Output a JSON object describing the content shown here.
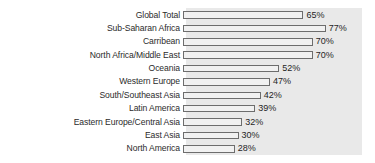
{
  "chart_data": {
    "type": "bar",
    "orientation": "horizontal",
    "title": "",
    "subtitle": "",
    "xlabel": "",
    "ylabel": "",
    "xlim": [
      0,
      95
    ],
    "grid": false,
    "legend": null,
    "value_suffix": "%",
    "categories": [
      "Global Total",
      "Sub-Saharan Africa",
      "Carribean",
      "North Africa/Middle East",
      "Oceania",
      "Western Europe",
      "South/Southeast Asia",
      "Latin America",
      "Eastern Europe/Central Asia",
      "East Asia",
      "North America"
    ],
    "values": [
      65,
      77,
      70,
      70,
      52,
      47,
      42,
      39,
      32,
      30,
      28
    ],
    "value_labels": [
      "65%",
      "77%",
      "70%",
      "70%",
      "52%",
      "47%",
      "42%",
      "39%",
      "32%",
      "30%",
      "28%"
    ]
  },
  "style": {
    "plot_background": "#e9e9e9",
    "bar_fill": "#f1f1f1",
    "bar_stroke": "#6d6d6d",
    "label_color": "#2b2b2b",
    "value_color": "#1f1f1f",
    "page_background": "#ffffff"
  }
}
